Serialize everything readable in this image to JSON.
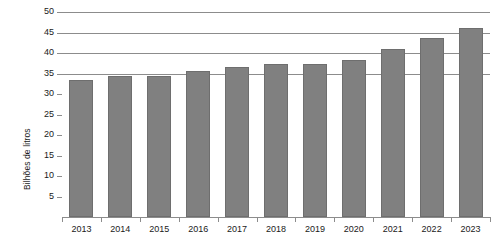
{
  "chart_data": {
    "type": "bar",
    "title": "",
    "subtitle": "",
    "xlabel": "",
    "ylabel": "Bilhões de litros",
    "categories": [
      "2013",
      "2014",
      "2015",
      "2016",
      "2017",
      "2018",
      "2019",
      "2020",
      "2021",
      "2022",
      "2023"
    ],
    "values": [
      33.5,
      34.3,
      34.3,
      35.5,
      36.5,
      37.2,
      37.2,
      38.3,
      41.0,
      43.7,
      46.0
    ],
    "series": [
      {
        "name": "Bilhões de litros",
        "values": [
          33.5,
          34.3,
          34.3,
          35.5,
          36.5,
          37.2,
          37.2,
          38.3,
          41.0,
          43.7,
          46.0
        ]
      }
    ],
    "ylim": [
      0,
      50
    ],
    "ytick_values": [
      5,
      10,
      15,
      20,
      25,
      30,
      35,
      40,
      45,
      50
    ],
    "ytick_labels": [
      "5",
      "10",
      "15",
      "20",
      "25",
      "30",
      "35",
      "40",
      "45",
      "50"
    ],
    "gridline_values": [
      35,
      40,
      45,
      50
    ],
    "grid": true,
    "legend": false,
    "legend_position": "none",
    "bar_color": "#808080",
    "bar_edge_color": "#6e6e6e",
    "axis_color": "#8c8c8c",
    "background_color": "#ffffff",
    "annotations": []
  }
}
